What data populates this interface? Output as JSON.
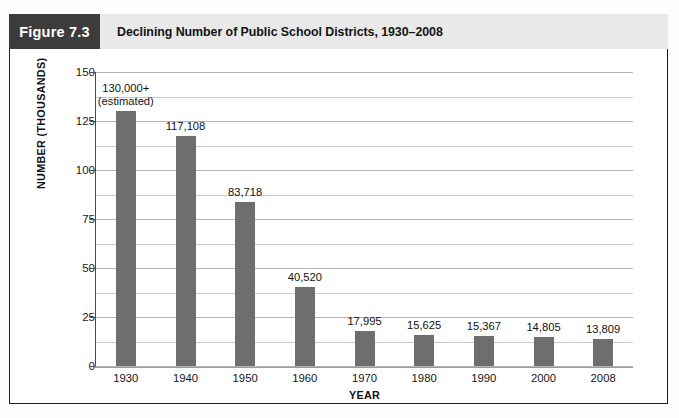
{
  "header": {
    "figure_badge": "Figure 7.3",
    "title": "Declining Number of Public School Districts, 1930–2008",
    "badge_bg": "#3c3c3c",
    "bar_bg": "#e9e9e9"
  },
  "chart_data": {
    "type": "bar",
    "title": "Declining Number of Public School Districts, 1930–2008",
    "xlabel": "YEAR",
    "ylabel": "NUMBER (THOUSANDS)",
    "categories": [
      "1930",
      "1940",
      "1950",
      "1960",
      "1970",
      "1980",
      "1990",
      "2000",
      "2008"
    ],
    "values": [
      130.0,
      117.108,
      83.718,
      40.52,
      17.995,
      15.625,
      15.367,
      14.805,
      13.809
    ],
    "point_labels": [
      "130,000+\n(estimated)",
      "117,108",
      "83,718",
      "40,520",
      "17,995",
      "15,625",
      "15,367",
      "14,805",
      "13,809"
    ],
    "ylim": [
      0,
      150
    ],
    "ytick_labels": [
      "0",
      "25",
      "50",
      "75",
      "100",
      "125",
      "150"
    ],
    "ytick_values": [
      0,
      25,
      50,
      75,
      100,
      125,
      150
    ],
    "minor_gridline_step": 12.5,
    "grid": true,
    "legend": false,
    "bar_color": "#6e6e6e",
    "gridline_color": "#c9c9c9"
  },
  "labels": {
    "y_axis_title": "NUMBER (THOUSANDS)",
    "x_axis_title": "YEAR"
  }
}
